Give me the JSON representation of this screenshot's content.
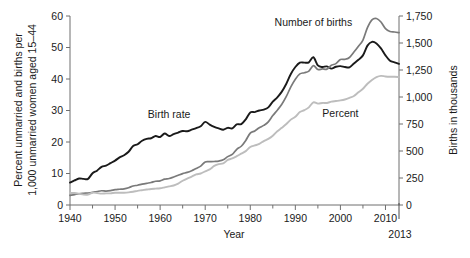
{
  "chart_data": {
    "type": "line",
    "title": "",
    "xlabel": "Year",
    "ylabel_left": "Percent unmarried and births per 1,000 unmarried women aged 15–44",
    "ylabel_right": "Births in thousands",
    "xlim": [
      1940,
      2013
    ],
    "xticks": [
      1940,
      1950,
      1960,
      1970,
      1980,
      1990,
      2000,
      2010
    ],
    "xticklabels": [
      "1940",
      "1950",
      "1960",
      "1970",
      "1980",
      "1990",
      "2000",
      "2010"
    ],
    "x_end_label": "2013",
    "ylim_left": [
      0,
      60
    ],
    "yticks_left": [
      0,
      10,
      20,
      30,
      40,
      50,
      60
    ],
    "yticklabels_left": [
      "0",
      "10",
      "20",
      "30",
      "40",
      "50",
      "60"
    ],
    "ylim_right": [
      0,
      1750
    ],
    "yticks_right": [
      0,
      250,
      500,
      750,
      1000,
      1250,
      1500,
      1750
    ],
    "yticklabels_right": [
      "0",
      "250",
      "500",
      "750",
      "1,000",
      "1,250",
      "1,500",
      "1,750"
    ],
    "grid": false,
    "legend_position": "inline-labels",
    "minor_tick_interval_years": 5,
    "series": [
      {
        "name": "Birth rate",
        "label": "Birth rate",
        "axis": "left",
        "color": "#1a1a1a",
        "width": 1.9,
        "label_x": 1962,
        "label_y": 27.5,
        "x": [
          1940,
          1941,
          1942,
          1943,
          1944,
          1945,
          1946,
          1947,
          1948,
          1949,
          1950,
          1951,
          1952,
          1953,
          1954,
          1955,
          1956,
          1957,
          1958,
          1959,
          1960,
          1961,
          1962,
          1963,
          1964,
          1965,
          1966,
          1967,
          1968,
          1969,
          1970,
          1971,
          1972,
          1973,
          1974,
          1975,
          1976,
          1977,
          1978,
          1979,
          1980,
          1981,
          1982,
          1983,
          1984,
          1985,
          1986,
          1987,
          1988,
          1989,
          1990,
          1991,
          1992,
          1993,
          1994,
          1995,
          1996,
          1997,
          1998,
          1999,
          2000,
          2001,
          2002,
          2003,
          2004,
          2005,
          2006,
          2007,
          2008,
          2009,
          2010,
          2011,
          2012,
          2013
        ],
        "y": [
          7.1,
          7.8,
          8.4,
          8.3,
          8.3,
          10.1,
          10.9,
          12.1,
          12.5,
          13.3,
          14.1,
          15.1,
          15.8,
          16.9,
          18.7,
          19.3,
          20.4,
          21.0,
          21.2,
          21.9,
          21.6,
          22.7,
          21.9,
          22.5,
          23.0,
          23.5,
          23.4,
          23.9,
          24.4,
          25.0,
          26.4,
          25.5,
          24.8,
          24.3,
          23.9,
          24.5,
          24.3,
          25.6,
          25.7,
          27.2,
          29.4,
          29.5,
          30.0,
          30.3,
          31.0,
          32.8,
          34.2,
          36.0,
          38.5,
          41.6,
          43.8,
          45.2,
          45.2,
          45.3,
          46.9,
          44.3,
          43.8,
          44.0,
          43.3,
          43.9,
          44.1,
          43.8,
          43.7,
          44.9,
          46.1,
          47.5,
          50.6,
          51.8,
          51.3,
          49.7,
          47.5,
          45.8,
          45.3,
          44.8
        ]
      },
      {
        "name": "Number of births",
        "label": "Number of births",
        "axis": "right",
        "color": "#7a7a7a",
        "width": 1.7,
        "label_x": 1994,
        "label_y_right": 1660,
        "x": [
          1940,
          1941,
          1942,
          1943,
          1944,
          1945,
          1946,
          1947,
          1948,
          1949,
          1950,
          1951,
          1952,
          1953,
          1954,
          1955,
          1956,
          1957,
          1958,
          1959,
          1960,
          1961,
          1962,
          1963,
          1964,
          1965,
          1966,
          1967,
          1968,
          1969,
          1970,
          1971,
          1972,
          1973,
          1974,
          1975,
          1976,
          1977,
          1978,
          1979,
          1980,
          1981,
          1982,
          1983,
          1984,
          1985,
          1986,
          1987,
          1988,
          1989,
          1990,
          1991,
          1992,
          1993,
          1994,
          1995,
          1996,
          1997,
          1998,
          1999,
          2000,
          2001,
          2002,
          2003,
          2004,
          2005,
          2006,
          2007,
          2008,
          2009,
          2010,
          2011,
          2012,
          2013
        ],
        "y": [
          89,
          96,
          104,
          108,
          111,
          117,
          125,
          132,
          129,
          133,
          142,
          146,
          150,
          160,
          176,
          183,
          193,
          201,
          208,
          220,
          224,
          240,
          245,
          259,
          275,
          291,
          302,
          318,
          339,
          360,
          399,
          401,
          403,
          407,
          418,
          448,
          468,
          516,
          544,
          598,
          666,
          686,
          715,
          737,
          770,
          828,
          878,
          933,
          1005,
          1094,
          1165,
          1214,
          1225,
          1240,
          1290,
          1254,
          1260,
          1258,
          1294,
          1309,
          1347,
          1349,
          1366,
          1416,
          1470,
          1527,
          1642,
          1715,
          1727,
          1694,
          1633,
          1607,
          1602,
          1596
        ]
      },
      {
        "name": "Percent",
        "label": "Percent",
        "axis": "left",
        "color": "#bdbdbd",
        "width": 1.9,
        "label_x": 2000,
        "label_y": 28.0,
        "x": [
          1940,
          1941,
          1942,
          1943,
          1944,
          1945,
          1946,
          1947,
          1948,
          1949,
          1950,
          1951,
          1952,
          1953,
          1954,
          1955,
          1956,
          1957,
          1958,
          1959,
          1960,
          1961,
          1962,
          1963,
          1964,
          1965,
          1966,
          1967,
          1968,
          1969,
          1970,
          1971,
          1972,
          1973,
          1974,
          1975,
          1976,
          1977,
          1978,
          1979,
          1980,
          1981,
          1982,
          1983,
          1984,
          1985,
          1986,
          1987,
          1988,
          1989,
          1990,
          1991,
          1992,
          1993,
          1994,
          1995,
          1996,
          1997,
          1998,
          1999,
          2000,
          2001,
          2002,
          2003,
          2004,
          2005,
          2006,
          2007,
          2008,
          2009,
          2010,
          2011,
          2012,
          2013
        ],
        "y": [
          3.8,
          3.8,
          3.6,
          3.3,
          3.3,
          3.9,
          3.8,
          3.6,
          3.7,
          3.7,
          3.9,
          3.9,
          3.9,
          4.0,
          4.2,
          4.5,
          4.7,
          4.9,
          5.1,
          5.2,
          5.3,
          5.6,
          5.9,
          6.2,
          6.8,
          7.7,
          8.4,
          9.0,
          9.7,
          10.0,
          10.7,
          11.3,
          12.4,
          13.0,
          13.2,
          14.3,
          14.8,
          15.5,
          16.3,
          17.1,
          18.4,
          18.9,
          19.4,
          20.3,
          21.0,
          22.0,
          23.4,
          24.5,
          25.7,
          27.1,
          28.0,
          29.5,
          30.1,
          31.0,
          32.6,
          32.2,
          32.4,
          32.4,
          32.8,
          33.0,
          33.2,
          33.5,
          34.0,
          34.6,
          35.8,
          36.9,
          38.5,
          39.7,
          40.6,
          41.0,
          40.8,
          40.7,
          40.7,
          40.6
        ]
      }
    ]
  }
}
